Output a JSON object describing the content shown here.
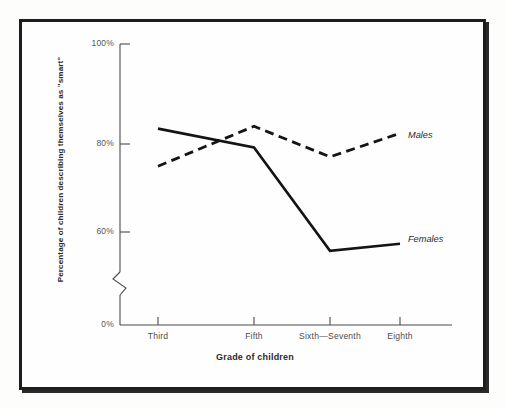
{
  "chart_data": {
    "type": "line",
    "title": "",
    "xlabel": "Grade of children",
    "ylabel": "Percentage of children describing themselves as \"smart\"",
    "categories": [
      "Third",
      "Fifth",
      "Sixth—Seventh",
      "Eighth"
    ],
    "series": [
      {
        "name": "Males",
        "values": [
          74,
          82.5,
          76,
          81
        ],
        "style": "dashed"
      },
      {
        "name": "Females",
        "values": [
          82,
          78,
          56,
          57.5
        ],
        "style": "solid"
      }
    ],
    "ytick_labels": [
      "100%",
      "80%",
      "60%",
      "0%"
    ],
    "ytick_values": [
      100,
      80,
      60,
      0
    ],
    "ylim": [
      0,
      100
    ],
    "axis_break": true,
    "axis_break_between": [
      0,
      60
    ],
    "grid": false,
    "legend": "inline-right",
    "colors": {
      "line": "#141414",
      "axis": "#4a4a4a",
      "frame": "#1d1d1d"
    }
  },
  "axis": {
    "y_labels": {
      "hundred": "100%",
      "eighty": "80%",
      "sixty": "60%",
      "zero": "0%"
    },
    "y_title": "Percentage of children describing themselves as \"smart\"",
    "x_title": "Grade of children",
    "x_labels": {
      "third": "Third",
      "fifth": "Fifth",
      "sixth_seventh": "Sixth—Seventh",
      "eighth": "Eighth"
    }
  },
  "series_labels": {
    "males": "Males",
    "females": "Females"
  }
}
